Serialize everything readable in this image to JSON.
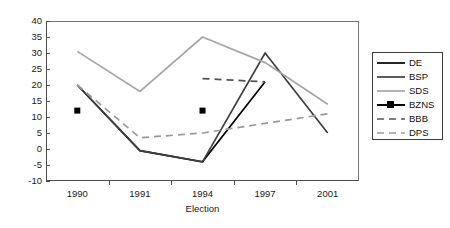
{
  "chart_data": {
    "type": "line",
    "title": "",
    "xlabel": "Election",
    "ylabel": "",
    "categories": [
      "1990",
      "1991",
      "1994",
      "1997",
      "2001"
    ],
    "ylim": [
      -10,
      40
    ],
    "ytick_step": 5,
    "yticks": [
      "40",
      "35",
      "30",
      "25",
      "20",
      "15",
      "10",
      "5",
      "0",
      "-5",
      "-10"
    ],
    "grid": false,
    "legend_position": "right",
    "series": [
      {
        "name": "DE",
        "color": "#000000",
        "style": "solid",
        "marker": "none",
        "values": [
          20,
          -0.5,
          -4,
          21,
          null
        ]
      },
      {
        "name": "BSP",
        "color": "#3f3f3f",
        "style": "solid",
        "marker": "none",
        "values": [
          20,
          -0.5,
          -4,
          30,
          5
        ]
      },
      {
        "name": "SDS",
        "color": "#a6a6a6",
        "style": "solid",
        "marker": "none",
        "values": [
          30.5,
          18,
          35,
          27,
          14
        ]
      },
      {
        "name": "BZNS",
        "color": "#000000",
        "style": "solid",
        "marker": "square",
        "values": [
          12,
          null,
          12,
          null,
          null
        ]
      },
      {
        "name": "BBB",
        "color": "#555555",
        "style": "dashed",
        "marker": "none",
        "values": [
          null,
          null,
          22,
          21,
          null
        ]
      },
      {
        "name": "DPS",
        "color": "#9a9a9a",
        "style": "dashed",
        "marker": "none",
        "values": [
          20,
          3.5,
          5,
          8,
          11
        ]
      }
    ]
  },
  "axis": {
    "x_title": "Election"
  }
}
